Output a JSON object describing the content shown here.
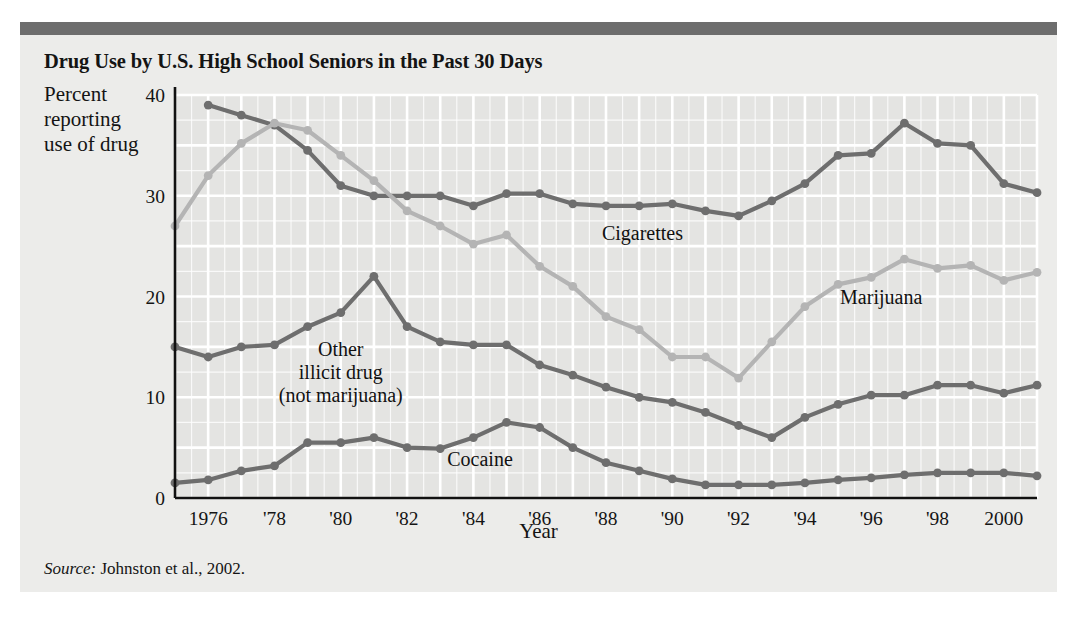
{
  "figure": {
    "title": "Drug Use by U.S. High School Seniors in the Past 30 Days",
    "y_axis_caption": "Percent\nreporting\nuse of drug",
    "x_axis_title": "Year",
    "source_word": "Source:",
    "source_text": " Johnston et al., 2002.",
    "colors": {
      "background": "#ececea",
      "topbar": "#6d6d6d",
      "grid": "#ffffff",
      "plot_fill": "#e4e4e2",
      "axis": "#111111",
      "dark_series": "#6e6e6e",
      "light_series": "#b4b4b4",
      "text": "#141414"
    }
  },
  "chart_data": {
    "type": "line",
    "title": "Drug Use by U.S. High School Seniors in the Past 30 Days",
    "xlabel": "Year",
    "ylabel": "Percent reporting use of drug",
    "xlim": [
      1975,
      2001
    ],
    "ylim": [
      0,
      40
    ],
    "yticks": [
      0,
      10,
      20,
      30,
      40
    ],
    "ytick_labels": [
      "0",
      "10",
      "20",
      "30",
      "40"
    ],
    "xticks": [
      1976,
      1978,
      1980,
      1982,
      1984,
      1986,
      1988,
      1990,
      1992,
      1994,
      1996,
      1998,
      2000
    ],
    "xtick_labels": [
      "1976",
      "'78",
      "'80",
      "'82",
      "'84",
      "'86",
      "'88",
      "'90",
      "'92",
      "'94",
      "'96",
      "'98",
      "2000"
    ],
    "grid": true,
    "legend": "inline-labels",
    "x": [
      1975,
      1976,
      1977,
      1978,
      1979,
      1980,
      1981,
      1982,
      1983,
      1984,
      1985,
      1986,
      1987,
      1988,
      1989,
      1990,
      1991,
      1992,
      1993,
      1994,
      1995,
      1996,
      1997,
      1998,
      1999,
      2000,
      2001
    ],
    "series": [
      {
        "name": "Cigarettes",
        "color": "#6e6e6e",
        "label_x": 1989.1,
        "label_y": 25.6,
        "values": [
          null,
          39.0,
          38.0,
          37.0,
          34.5,
          31.0,
          30.0,
          30.0,
          30.0,
          29.0,
          30.2,
          30.2,
          29.2,
          29.0,
          29.0,
          29.2,
          28.5,
          28.0,
          29.5,
          31.2,
          34.0,
          34.2,
          37.2,
          35.2,
          35.0,
          31.2,
          30.3
        ]
      },
      {
        "name": "Marijuana",
        "color": "#b4b4b4",
        "label_x": 1996.3,
        "label_y": 19.3,
        "values": [
          27.0,
          32.0,
          35.2,
          37.2,
          36.5,
          34.0,
          31.5,
          28.5,
          27.0,
          25.2,
          26.1,
          23.0,
          21.0,
          18.0,
          16.7,
          14.0,
          14.0,
          11.9,
          15.5,
          19.0,
          21.2,
          21.9,
          23.7,
          22.8,
          23.1,
          21.6,
          22.4
        ]
      },
      {
        "name": "Other illicit drug (not marijuana)",
        "color": "#6e6e6e",
        "label_x": 1980.0,
        "label_y": 14.1,
        "label_lines": [
          "Other",
          "illicit drug",
          "(not marijuana)"
        ],
        "values": [
          15.0,
          14.0,
          15.0,
          15.2,
          17.0,
          18.4,
          22.0,
          17.0,
          15.5,
          15.2,
          15.2,
          13.2,
          12.2,
          11.0,
          10.0,
          9.5,
          8.5,
          7.2,
          6.0,
          8.0,
          9.3,
          10.2,
          10.2,
          11.2,
          11.2,
          10.4,
          11.2
        ]
      },
      {
        "name": "Cocaine",
        "color": "#6e6e6e",
        "label_x": 1984.2,
        "label_y": 3.2,
        "values": [
          1.5,
          1.8,
          2.7,
          3.2,
          5.5,
          5.5,
          6.0,
          5.0,
          4.9,
          6.0,
          7.5,
          7.0,
          5.0,
          3.5,
          2.7,
          1.9,
          1.3,
          1.3,
          1.3,
          1.5,
          1.8,
          2.0,
          2.3,
          2.5,
          2.5,
          2.5,
          2.2
        ]
      }
    ]
  }
}
